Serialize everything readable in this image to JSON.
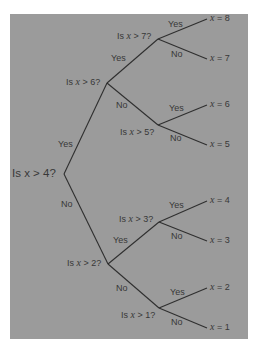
{
  "diagram": {
    "type": "binary decision tree",
    "colors": {
      "background": "#9b9b9b",
      "line": "#2f2f2f",
      "text": "#383838"
    },
    "root": {
      "question": "Is x > 4?"
    },
    "nodes": [
      {
        "id": "q6",
        "prefix": "Is ",
        "var": "x",
        "suffix": " > 6?"
      },
      {
        "id": "q7",
        "prefix": "Is ",
        "var": "x",
        "suffix": " > 7?"
      },
      {
        "id": "q5",
        "prefix": "Is ",
        "var": "x",
        "suffix": " > 5?"
      },
      {
        "id": "q2",
        "prefix": "Is ",
        "var": "x",
        "suffix": " > 2?"
      },
      {
        "id": "q3",
        "prefix": "Is ",
        "var": "x",
        "suffix": " > 3?"
      },
      {
        "id": "q1",
        "prefix": "Is ",
        "var": "x",
        "suffix": " > 1?"
      }
    ],
    "branch_labels": {
      "yes": "Yes",
      "no": "No"
    },
    "leaves": [
      {
        "var": "x",
        "text": " = 8"
      },
      {
        "var": "x",
        "text": " = 7"
      },
      {
        "var": "x",
        "text": " = 6"
      },
      {
        "var": "x",
        "text": " = 5"
      },
      {
        "var": "x",
        "text": " = 4"
      },
      {
        "var": "x",
        "text": " = 3"
      },
      {
        "var": "x",
        "text": " = 2"
      },
      {
        "var": "x",
        "text": " = 1"
      }
    ]
  }
}
